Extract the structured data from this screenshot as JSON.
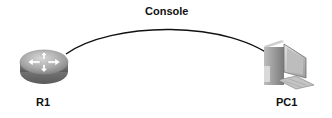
{
  "diagram": {
    "link": {
      "label": "Console",
      "color": "#111111"
    },
    "devices": [
      {
        "id": "r1",
        "label": "R1",
        "type": "router"
      },
      {
        "id": "pc1",
        "label": "PC1",
        "type": "pc"
      }
    ]
  }
}
